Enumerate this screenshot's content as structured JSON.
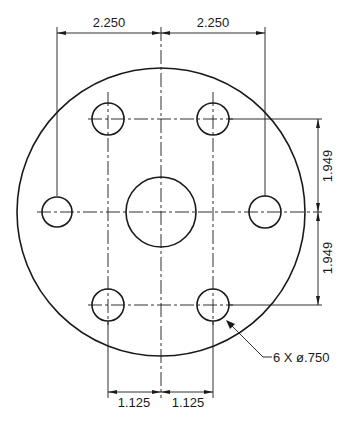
{
  "drawing": {
    "title": "Bolt flange hole pattern",
    "dimensions": {
      "top_left": "2.250",
      "top_right": "2.250",
      "right_upper": "1.949",
      "right_lower": "1.949",
      "bottom_left": "1.125",
      "bottom_right": "1.125"
    },
    "callout": {
      "hole_count": "6",
      "text": "6 X ø.750"
    },
    "features": {
      "outer_circle": {
        "cx": 161,
        "cy": 212,
        "r": 144
      },
      "center_hole": {
        "cx": 161,
        "cy": 212,
        "r": 35
      },
      "bolt_holes": [
        {
          "cx": 108,
          "cy": 119,
          "r": 16
        },
        {
          "cx": 213,
          "cy": 119,
          "r": 16
        },
        {
          "cx": 57,
          "cy": 212,
          "r": 16
        },
        {
          "cx": 265,
          "cy": 212,
          "r": 16
        },
        {
          "cx": 108,
          "cy": 305,
          "r": 16
        },
        {
          "cx": 213,
          "cy": 305,
          "r": 16
        }
      ]
    },
    "colors": {
      "line": "#1a1a1a",
      "background": "#ffffff"
    }
  }
}
